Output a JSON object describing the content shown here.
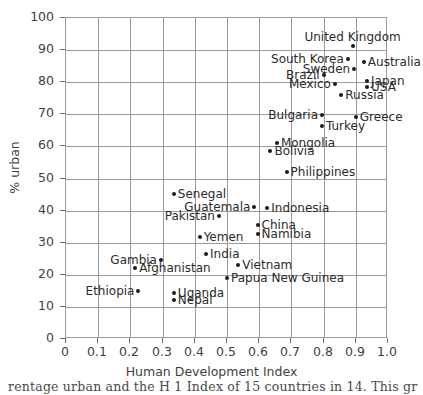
{
  "chart_data": {
    "type": "scatter",
    "title": "",
    "xlabel": "Human Development Index",
    "ylabel": "% urban",
    "xlim": [
      0,
      1.0
    ],
    "ylim": [
      0,
      100
    ],
    "xticks": [
      "0",
      "0.1",
      "0.2",
      "0.3",
      "0.4",
      "0.5",
      "0.6",
      "0.7",
      "0.8",
      "0.9",
      "1.0"
    ],
    "xtick_values": [
      0,
      0.1,
      0.2,
      0.3,
      0.4,
      0.5,
      0.6,
      0.7,
      0.8,
      0.9,
      1.0
    ],
    "yticks": [
      "0",
      "10",
      "20",
      "30",
      "40",
      "50",
      "60",
      "70",
      "80",
      "90",
      "100"
    ],
    "ytick_values": [
      0,
      10,
      20,
      30,
      40,
      50,
      60,
      70,
      80,
      90,
      100
    ],
    "grid": true,
    "legend": "none",
    "marker_color": "#1a1a1a",
    "grid_color": "#9a9a9a",
    "points": [
      {
        "label": "United Kingdom",
        "x": 0.89,
        "y": 91.2,
        "label_pos": "above"
      },
      {
        "label": "South Korea",
        "x": 0.875,
        "y": 87.3,
        "label_pos": "left"
      },
      {
        "label": "Australia",
        "x": 0.925,
        "y": 86.2,
        "label_pos": "right"
      },
      {
        "label": "Sweden",
        "x": 0.895,
        "y": 84.0,
        "label_pos": "left"
      },
      {
        "label": "Brazil",
        "x": 0.8,
        "y": 82.1,
        "label_pos": "left"
      },
      {
        "label": "Japan",
        "x": 0.935,
        "y": 80.3,
        "label_pos": "right"
      },
      {
        "label": "Mexico",
        "x": 0.835,
        "y": 79.4,
        "label_pos": "left"
      },
      {
        "label": "USA",
        "x": 0.935,
        "y": 78.6,
        "label_pos": "right"
      },
      {
        "label": "Russia",
        "x": 0.855,
        "y": 75.9,
        "label_pos": "right"
      },
      {
        "label": "Greece",
        "x": 0.9,
        "y": 69.3,
        "label_pos": "right"
      },
      {
        "label": "Bulgaria",
        "x": 0.795,
        "y": 69.8,
        "label_pos": "left"
      },
      {
        "label": "Turkey",
        "x": 0.795,
        "y": 66.2,
        "label_pos": "right"
      },
      {
        "label": "Mongolia",
        "x": 0.655,
        "y": 61.0,
        "label_pos": "right"
      },
      {
        "label": "Bolivia",
        "x": 0.635,
        "y": 58.5,
        "label_pos": "right"
      },
      {
        "label": "Philippines",
        "x": 0.685,
        "y": 52.0,
        "label_pos": "right"
      },
      {
        "label": "Senegal",
        "x": 0.335,
        "y": 45.2,
        "label_pos": "right"
      },
      {
        "label": "Guatemala",
        "x": 0.585,
        "y": 41.0,
        "label_pos": "left"
      },
      {
        "label": "Indonesia",
        "x": 0.625,
        "y": 40.8,
        "label_pos": "right"
      },
      {
        "label": "Pakistan",
        "x": 0.475,
        "y": 38.3,
        "label_pos": "left"
      },
      {
        "label": "China",
        "x": 0.595,
        "y": 35.4,
        "label_pos": "right"
      },
      {
        "label": "Namibia",
        "x": 0.595,
        "y": 32.8,
        "label_pos": "right"
      },
      {
        "label": "Yemen",
        "x": 0.415,
        "y": 31.8,
        "label_pos": "right"
      },
      {
        "label": "India",
        "x": 0.435,
        "y": 26.5,
        "label_pos": "right"
      },
      {
        "label": "Gambia",
        "x": 0.295,
        "y": 24.5,
        "label_pos": "left"
      },
      {
        "label": "Vietnam",
        "x": 0.535,
        "y": 23.0,
        "label_pos": "right"
      },
      {
        "label": "Afghanistan",
        "x": 0.215,
        "y": 22.1,
        "label_pos": "right"
      },
      {
        "label": "Papua New Guinea",
        "x": 0.5,
        "y": 18.9,
        "label_pos": "right"
      },
      {
        "label": "Ethiopia",
        "x": 0.225,
        "y": 14.9,
        "label_pos": "left"
      },
      {
        "label": "Uganda",
        "x": 0.335,
        "y": 14.2,
        "label_pos": "right"
      },
      {
        "label": "Nepal",
        "x": 0.335,
        "y": 12.3,
        "label_pos": "right"
      }
    ]
  },
  "caption": {
    "text": "rentage urban and the H 1 Index of 15 countries in 14. This gr"
  }
}
